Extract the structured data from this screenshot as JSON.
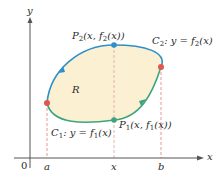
{
  "diagram": {
    "type": "region-between-curves",
    "colors": {
      "region_fill": "#fbf0d2",
      "upper_curve": "#2e90c9",
      "lower_curve": "#3fa47e",
      "endpoint_marker": "#e0574f",
      "dashed_guides": "#e48a8a",
      "axes": "#555555"
    },
    "axes": {
      "x_label": "x",
      "y_label": "y",
      "origin_label": "0"
    },
    "ticks": {
      "a": "a",
      "x": "x",
      "b": "b"
    },
    "region_label": "R",
    "curve_upper": {
      "name": "C",
      "subscript": "2",
      "eq_prefix": ": y = f",
      "eq_subscript": "2",
      "eq_suffix": "(x)"
    },
    "curve_lower": {
      "name": "C",
      "subscript": "1",
      "eq_prefix": ": y = f",
      "eq_subscript": "1",
      "eq_suffix": "(x)"
    },
    "point_upper": {
      "name": "P",
      "subscript": "2",
      "coord_prefix": "(x, f",
      "coord_subscript": "2",
      "coord_suffix": "(x))"
    },
    "point_lower": {
      "name": "P",
      "subscript": "1",
      "coord_prefix": "(x, f",
      "coord_subscript": "1",
      "coord_suffix": "(x))"
    }
  }
}
